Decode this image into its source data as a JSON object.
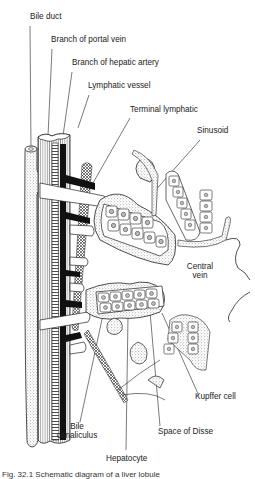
{
  "figure": {
    "type": "anatomical-diagram",
    "labels": [
      {
        "id": "bile-duct",
        "text": "Bile duct",
        "x": 30,
        "y": 16
      },
      {
        "id": "portal-vein",
        "text": "Branch of portal vein",
        "x": 51,
        "y": 39
      },
      {
        "id": "hepatic-artery",
        "text": "Branch of hepatic artery",
        "x": 72,
        "y": 62
      },
      {
        "id": "lymphatic-vessel",
        "text": "Lymphatic vessel",
        "x": 88,
        "y": 85
      },
      {
        "id": "terminal-lymphatic",
        "text": "Terminal lymphatic",
        "x": 130,
        "y": 109
      },
      {
        "id": "sinusoid",
        "text": "Sinusoid",
        "x": 197,
        "y": 130
      },
      {
        "id": "central-vein",
        "text": "Central\nvein",
        "x": 186,
        "y": 267
      },
      {
        "id": "kupffer-cell",
        "text": "Kupffer cell",
        "x": 195,
        "y": 396
      },
      {
        "id": "bile-canaliculus",
        "text": "Bile\ncanaliculus",
        "x": 56,
        "y": 425
      },
      {
        "id": "space-of-disse",
        "text": "Space of Disse",
        "x": 158,
        "y": 431
      },
      {
        "id": "hepatocyte",
        "text": "Hepatocyte",
        "x": 106,
        "y": 458
      }
    ],
    "caption": "Fig. 32.1 Schematic diagram of a liver lobule"
  },
  "colors": {
    "ink": "#1a1a1a",
    "paper": "#ffffff",
    "stipple": "#8a8a8a"
  }
}
